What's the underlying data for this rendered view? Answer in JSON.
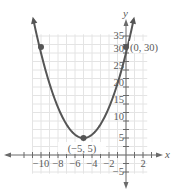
{
  "chart_data": {
    "type": "line",
    "title": "",
    "xlabel": "x",
    "ylabel": "y",
    "xlim": [
      -12,
      3
    ],
    "ylim": [
      -6,
      36
    ],
    "grid": true,
    "x_ticks": [
      -10,
      -8,
      -6,
      -4,
      -2,
      2
    ],
    "y_ticks": [
      -5,
      5,
      10,
      15,
      20,
      25,
      30,
      35
    ],
    "series": [
      {
        "name": "y = (x + 5)^2 + 5",
        "equation": "y = x^2 + 10x + 30",
        "x_range": [
          -10.9,
          0.9
        ],
        "color": "#555555"
      }
    ],
    "points": [
      {
        "x": -5,
        "y": 5,
        "label": "(−5, 5)"
      },
      {
        "x": 0,
        "y": 30,
        "label": "(0, 30)"
      },
      {
        "x": -10,
        "y": 30,
        "label": ""
      }
    ],
    "colors": {
      "curve": "#555555",
      "grid": "#e4e4e4",
      "axis": "#6a6a6a",
      "text": "#5a5a5a"
    }
  },
  "labels": {
    "x_axis": "x",
    "y_axis": "y",
    "vertex": "(−5, 5)",
    "y_intercept": "(0, 30)",
    "x_ticks": [
      "−10",
      "−8",
      "−6",
      "−4",
      "−2",
      "2"
    ],
    "y_ticks": [
      "35",
      "30",
      "25",
      "20",
      "15",
      "10",
      "5",
      "−5"
    ]
  }
}
